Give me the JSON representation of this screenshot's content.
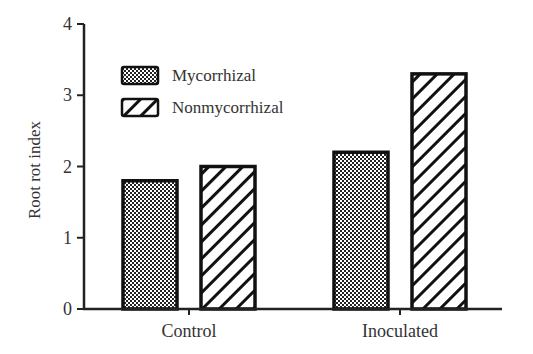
{
  "chart_data": {
    "type": "bar",
    "title": "",
    "xlabel": "",
    "ylabel": "Root rot index",
    "ylim": [
      0,
      4
    ],
    "yticks": [
      "0",
      "1",
      "2",
      "3",
      "4"
    ],
    "categories": [
      "Control",
      "Inoculated"
    ],
    "series": [
      {
        "name": "Mycorrhizal",
        "pattern": "crosshatch-dots",
        "values": [
          1.8,
          2.2
        ]
      },
      {
        "name": "Nonmycorrhizal",
        "pattern": "diagonal-stripes",
        "values": [
          2.0,
          3.3
        ]
      }
    ],
    "grid": false,
    "legend_position": "upper-left"
  }
}
